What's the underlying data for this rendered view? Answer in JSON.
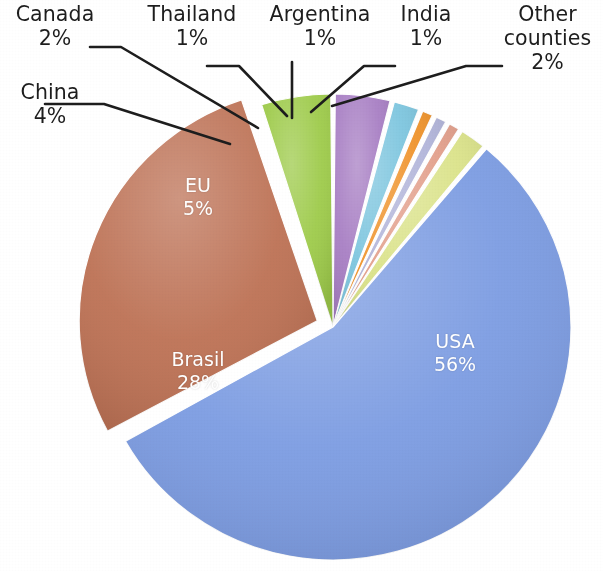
{
  "chart_data": {
    "type": "pie",
    "title": "",
    "subtitle": "",
    "xlabel": "",
    "ylabel": "",
    "legend_position": "none",
    "grid": false,
    "labels_show_percent": true,
    "exploded_slices": [
      "Brasil"
    ],
    "categories": [
      "USA",
      "Brasil",
      "EU",
      "China",
      "Canada",
      "Thailand",
      "Argentina",
      "India",
      "Other counties"
    ],
    "values": [
      56,
      28,
      5,
      4,
      2,
      1,
      1,
      1,
      2
    ],
    "value_labels": [
      "56%",
      "28%",
      "5%",
      "4%",
      "2%",
      "1%",
      "1%",
      "1%",
      "2%"
    ],
    "colors": [
      "#7c9ce2",
      "#bd7154",
      "#9ecb4a",
      "#a87fc4",
      "#7ec6df",
      "#f0942c",
      "#b2b5da",
      "#e3a08c",
      "#dbe38a"
    ],
    "slices": [
      {
        "name": "USA",
        "value": 56,
        "percent_label": "56%",
        "color": "#7c9ce2",
        "label_placement": "inside",
        "label_color": "#ffffff"
      },
      {
        "name": "Brasil",
        "value": 28,
        "percent_label": "28%",
        "color": "#bd7154",
        "label_placement": "inside",
        "label_color": "#ffffff"
      },
      {
        "name": "EU",
        "value": 5,
        "percent_label": "5%",
        "color": "#9ecb4a",
        "label_placement": "inside",
        "label_color": "#ffffff"
      },
      {
        "name": "China",
        "value": 4,
        "percent_label": "4%",
        "color": "#a87fc4",
        "label_placement": "outside",
        "label_color": "#1d1d1d"
      },
      {
        "name": "Canada",
        "value": 2,
        "percent_label": "2%",
        "color": "#7ec6df",
        "label_placement": "outside",
        "label_color": "#1d1d1d"
      },
      {
        "name": "Thailand",
        "value": 1,
        "percent_label": "1%",
        "color": "#f0942c",
        "label_placement": "outside",
        "label_color": "#1d1d1d"
      },
      {
        "name": "Argentina",
        "value": 1,
        "percent_label": "1%",
        "color": "#b2b5da",
        "label_placement": "outside",
        "label_color": "#1d1d1d"
      },
      {
        "name": "India",
        "value": 1,
        "percent_label": "1%",
        "color": "#e3a08c",
        "label_placement": "outside",
        "label_color": "#1d1d1d"
      },
      {
        "name": "Other counties",
        "value": 2,
        "percent_label": "2%",
        "color": "#dbe38a",
        "label_placement": "outside",
        "label_color": "#1d1d1d"
      }
    ]
  },
  "labels": {
    "canada": {
      "name": "Canada",
      "pct": "2%"
    },
    "china": {
      "name": "China",
      "pct": "4%"
    },
    "thailand": {
      "name": "Thailand",
      "pct": "1%"
    },
    "argentina": {
      "name": "Argentina",
      "pct": "1%"
    },
    "india": {
      "name": "India",
      "pct": "1%"
    },
    "other": {
      "name_line1": "Other",
      "name_line2": "counties",
      "pct": "2%"
    },
    "eu": {
      "name": "EU",
      "pct": "5%"
    },
    "brasil": {
      "name": "Brasil",
      "pct": "28%"
    },
    "usa": {
      "name": "USA",
      "pct": "56%"
    }
  }
}
